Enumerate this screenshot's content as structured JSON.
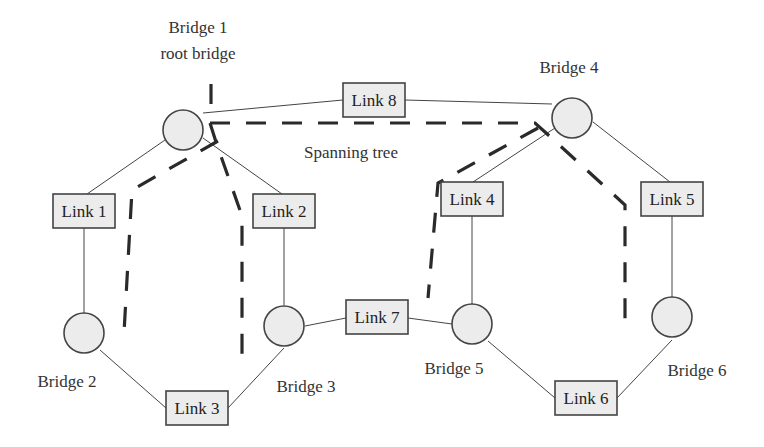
{
  "diagram": {
    "title": "Spanning tree",
    "bridges": [
      {
        "id": "b1",
        "label": "Bridge 1",
        "sublabel": "root bridge",
        "x": 183,
        "y": 130,
        "lx": 211,
        "ly": 33
      },
      {
        "id": "b2",
        "label": "Bridge 2",
        "x": 84,
        "y": 333,
        "lx": 66,
        "ly": 387
      },
      {
        "id": "b3",
        "label": "Bridge 3",
        "x": 284,
        "y": 326,
        "lx": 306,
        "ly": 392
      },
      {
        "id": "b4",
        "label": "Bridge 4",
        "x": 572,
        "y": 118,
        "lx": 569,
        "ly": 73
      },
      {
        "id": "b5",
        "label": "Bridge 5",
        "x": 472,
        "y": 324,
        "lx": 454,
        "ly": 374
      },
      {
        "id": "b6",
        "label": "Bridge 6",
        "x": 672,
        "y": 317,
        "lx": 697,
        "ly": 376
      }
    ],
    "links": [
      {
        "id": "l1",
        "label": "Link 1",
        "x": 53,
        "y": 194,
        "w": 62,
        "h": 34,
        "ends": [
          "b1",
          "b2"
        ]
      },
      {
        "id": "l2",
        "label": "Link 2",
        "x": 253,
        "y": 194,
        "w": 62,
        "h": 34,
        "ends": [
          "b1",
          "b3"
        ]
      },
      {
        "id": "l3",
        "label": "Link 3",
        "x": 166,
        "y": 391,
        "w": 62,
        "h": 34,
        "ends": [
          "b2",
          "b3"
        ]
      },
      {
        "id": "l4",
        "label": "Link 4",
        "x": 441,
        "y": 182,
        "w": 62,
        "h": 34,
        "ends": [
          "b4",
          "b5"
        ]
      },
      {
        "id": "l5",
        "label": "Link 5",
        "x": 641,
        "y": 182,
        "w": 62,
        "h": 34,
        "ends": [
          "b4",
          "b6"
        ]
      },
      {
        "id": "l6",
        "label": "Link 6",
        "x": 555,
        "y": 381,
        "w": 62,
        "h": 34,
        "ends": [
          "b5",
          "b6"
        ]
      },
      {
        "id": "l7",
        "label": "Link 7",
        "x": 346,
        "y": 300,
        "w": 62,
        "h": 34,
        "ends": [
          "b3",
          "b5"
        ]
      },
      {
        "id": "l8",
        "label": "Link 8",
        "x": 343,
        "y": 83,
        "w": 62,
        "h": 34,
        "ends": [
          "b1",
          "b4"
        ]
      }
    ],
    "spanning_tree_label": {
      "text": "Spanning tree",
      "x": 304,
      "y": 158
    },
    "colors": {
      "node_fill": "#ececec",
      "stroke": "#444444",
      "tree_stroke": "#2a2a2a"
    }
  }
}
